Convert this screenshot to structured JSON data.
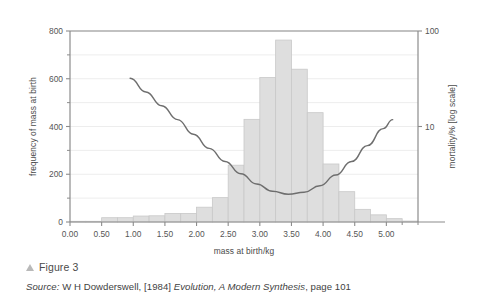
{
  "figure": {
    "marker_icon": "triangle-up-icon",
    "label": "Figure 3"
  },
  "source": {
    "prefix": "Source:",
    "author": "W H Dowderswell,",
    "year": "[1984]",
    "title": "Evolution, A Modern Synthesis",
    "page": ", page 101"
  },
  "colors": {
    "bar_fill": "#dedede",
    "bar_stroke": "#c9c9c9",
    "curve": "#6e6e6e",
    "axis": "#8c8c8c",
    "grid": "#ededed",
    "text": "#4a4a4a",
    "background": "#ffffff"
  },
  "chart_data": {
    "type": "bar",
    "title": "",
    "xlabel": "mass at birth/kg",
    "ylabel": "frequency of mass at birth",
    "y2label": "mortality/% [log scale]",
    "grid": true,
    "legend": "none",
    "xlim": [
      0.0,
      5.5
    ],
    "ylim": [
      0,
      800
    ],
    "y2lim": [
      1,
      100
    ],
    "y2_scale": "log",
    "xticks": [
      "0.00",
      "0.50",
      "1.00",
      "1.50",
      "2.00",
      "2.50",
      "3.00",
      "3.50",
      "4.00",
      "4.50",
      "5.00"
    ],
    "xtick_values": [
      0.0,
      0.5,
      1.0,
      1.5,
      2.0,
      2.5,
      3.0,
      3.5,
      4.0,
      4.5,
      5.0
    ],
    "yticks": [
      "0",
      "200",
      "400",
      "600",
      "800"
    ],
    "ytick_values": [
      0,
      200,
      400,
      600,
      800
    ],
    "yminor_values": [
      100,
      300,
      500,
      700
    ],
    "y2ticks": [
      "10",
      "100"
    ],
    "y2tick_values": [
      10,
      100
    ],
    "bin_width": 0.25,
    "categories": [
      "0.00-0.25",
      "0.25-0.50",
      "0.50-0.75",
      "0.75-1.00",
      "1.00-1.25",
      "1.25-1.50",
      "1.50-1.75",
      "1.75-2.00",
      "2.00-2.25",
      "2.25-2.50",
      "2.50-2.75",
      "2.75-3.00",
      "3.00-3.25",
      "3.25-3.50",
      "3.50-3.75",
      "3.75-4.00",
      "4.00-4.25",
      "4.25-4.50",
      "4.50-4.75",
      "4.75-5.00",
      "5.00-5.25",
      "5.25-5.50"
    ],
    "bin_starts": [
      0.0,
      0.25,
      0.5,
      0.75,
      1.0,
      1.25,
      1.5,
      1.75,
      2.0,
      2.25,
      2.5,
      2.75,
      3.0,
      3.25,
      3.5,
      3.75,
      4.0,
      4.25,
      4.5,
      4.75,
      5.0,
      5.25
    ],
    "values": [
      3,
      3,
      18,
      18,
      25,
      26,
      36,
      36,
      62,
      102,
      238,
      430,
      605,
      762,
      640,
      458,
      243,
      127,
      53,
      30,
      14,
      4
    ],
    "series": [
      {
        "name": "frequency of mass at birth",
        "type": "bar",
        "axis": "left",
        "values": [
          3,
          3,
          18,
          18,
          25,
          26,
          36,
          36,
          62,
          102,
          238,
          430,
          605,
          762,
          640,
          458,
          243,
          127,
          53,
          30,
          14,
          4
        ]
      },
      {
        "name": "mortality/%",
        "type": "line",
        "axis": "right",
        "x": [
          0.95,
          1.2,
          1.45,
          1.7,
          1.95,
          2.2,
          2.45,
          2.7,
          2.95,
          3.2,
          3.45,
          3.7,
          3.95,
          4.2,
          4.45,
          4.7,
          4.95,
          5.1
        ],
        "values": [
          32.0,
          23.0,
          16.5,
          11.8,
          8.3,
          5.9,
          4.3,
          3.2,
          2.5,
          2.1,
          1.95,
          2.05,
          2.4,
          3.1,
          4.3,
          6.3,
          9.5,
          11.8
        ]
      }
    ]
  }
}
